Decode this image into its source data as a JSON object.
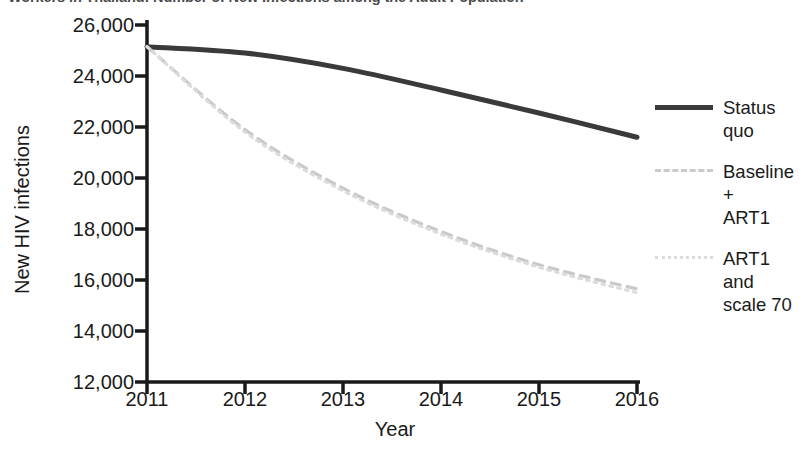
{
  "chart_data": {
    "type": "line",
    "title": "Workers in Thailand: Number of New Infections among the Adult Population",
    "xlabel": "Year",
    "ylabel": "New HIV infections",
    "categories": [
      2011,
      2012,
      2013,
      2014,
      2015,
      2016
    ],
    "x_tick_labels": [
      "2011",
      "2012",
      "2013",
      "2014",
      "2015",
      "2016"
    ],
    "y_tick_labels": [
      "12,000",
      "14,000",
      "16,000",
      "18,000",
      "20,000",
      "22,000",
      "24,000",
      "26,000"
    ],
    "y_tick_values": [
      12000,
      14000,
      16000,
      18000,
      20000,
      22000,
      24000,
      26000
    ],
    "xlim": [
      2011,
      2016
    ],
    "ylim": [
      12000,
      26000
    ],
    "grid": false,
    "legend_position": "right",
    "series": [
      {
        "name": "Status quo",
        "label_lines": [
          "Status",
          "quo"
        ],
        "style": "solid",
        "color": "#3a3a3a",
        "values": [
          25150,
          24900,
          24300,
          23450,
          22550,
          21600
        ]
      },
      {
        "name": "Baseline + ART1",
        "label_lines": [
          "Baseline +",
          "ART1"
        ],
        "style": "dashed",
        "color": "#c9c9c9",
        "values": [
          25150,
          21900,
          19600,
          17900,
          16600,
          15650
        ]
      },
      {
        "name": "ART1 and scale 70",
        "label_lines": [
          "ART1 and",
          "scale 70"
        ],
        "style": "dotted",
        "color": "#dcdcdc",
        "values": [
          25150,
          21800,
          19500,
          17800,
          16500,
          15500
        ]
      }
    ]
  },
  "legend": [
    {
      "label": "Status quo",
      "line1": "Status",
      "line2": "quo",
      "swatch": "sw-solid"
    },
    {
      "label": "Baseline + ART1",
      "line1": "Baseline +",
      "line2": "ART1",
      "swatch": "sw-dashed"
    },
    {
      "label": "ART1 and scale 70",
      "line1": "ART1 and",
      "line2": "scale 70",
      "swatch": "sw-dotted"
    }
  ]
}
